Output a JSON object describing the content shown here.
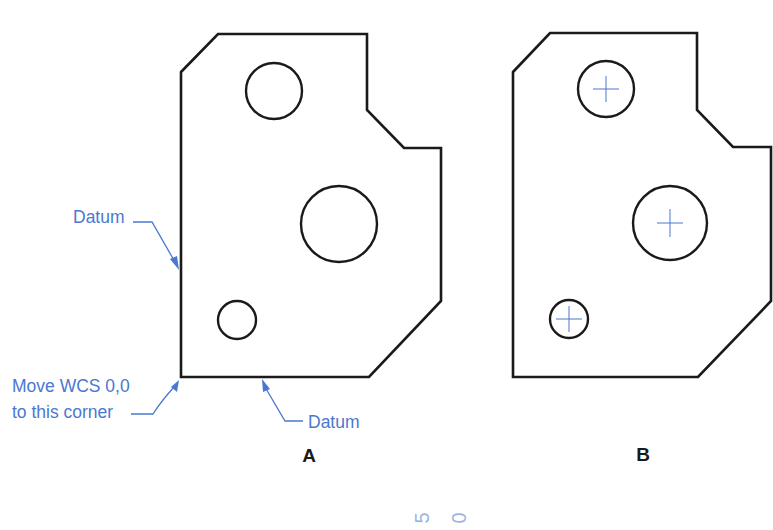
{
  "figure": {
    "part_a": {
      "label": "A",
      "callouts": {
        "datum_left": "Datum",
        "datum_bottom": "Datum",
        "origin_line1": "Move WCS 0,0",
        "origin_line2": "to this corner"
      },
      "holes": [
        {
          "name": "upper-hole",
          "cx": 274,
          "cy": 91,
          "r": 28
        },
        {
          "name": "large-hole",
          "cx": 339,
          "cy": 224,
          "r": 38
        },
        {
          "name": "small-hole",
          "cx": 237,
          "cy": 320,
          "r": 19
        }
      ]
    },
    "part_b": {
      "label": "B",
      "holes": [
        {
          "name": "upper-hole",
          "cx": 606,
          "cy": 89,
          "r": 28,
          "center_mark": true
        },
        {
          "name": "large-hole",
          "cx": 670,
          "cy": 223,
          "r": 37,
          "center_mark": true
        },
        {
          "name": "small-hole",
          "cx": 569,
          "cy": 319,
          "r": 19,
          "center_mark": true
        }
      ]
    },
    "bleed_text": [
      "5",
      "0"
    ],
    "colors": {
      "outline": "#1a1a1a",
      "annotation": "#4a78d0"
    }
  }
}
